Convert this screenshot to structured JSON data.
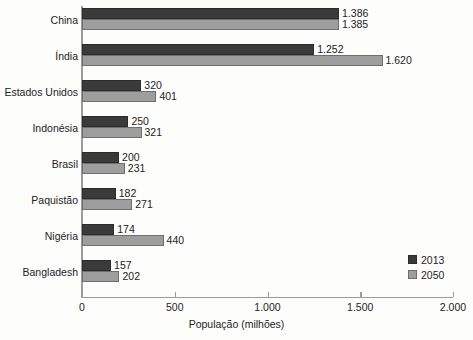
{
  "chart_data": {
    "type": "bar",
    "orientation": "horizontal",
    "title": "",
    "xlabel": "População (milhões)",
    "ylabel": "",
    "xlim": [
      0,
      2000
    ],
    "xticks": [
      0,
      500,
      1000,
      1500,
      2000
    ],
    "xtick_labels": [
      "0",
      "500",
      "1.000",
      "1.500",
      "2.000"
    ],
    "grid": false,
    "legend_position": "bottom-right",
    "categories": [
      "China",
      "Índia",
      "Estados Unidos",
      "Indonésia",
      "Brasil",
      "Paquistão",
      "Nigéria",
      "Bangladesh"
    ],
    "series": [
      {
        "name": "2013",
        "color": "#3a3a3a",
        "values": [
          1386,
          1252,
          320,
          250,
          200,
          182,
          174,
          157
        ],
        "data_labels": [
          "1.386",
          "1.252",
          "320",
          "250",
          "200",
          "182",
          "174",
          "157"
        ]
      },
      {
        "name": "2050",
        "color": "#9e9e9e",
        "values": [
          1385,
          1620,
          401,
          321,
          231,
          271,
          440,
          202
        ],
        "data_labels": [
          "1.385",
          "1.620",
          "401",
          "321",
          "231",
          "271",
          "440",
          "202"
        ]
      }
    ]
  },
  "legend": {
    "items": [
      {
        "label": "2013",
        "color": "#3a3a3a"
      },
      {
        "label": "2050",
        "color": "#9e9e9e"
      }
    ]
  },
  "axis": {
    "x_title": "População (milhões)"
  }
}
